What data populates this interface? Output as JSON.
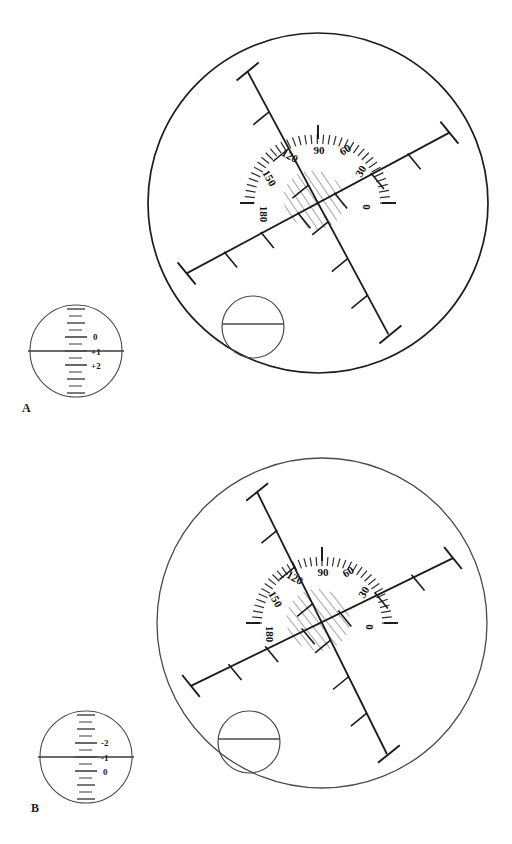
{
  "figure": {
    "background_color": "#ffffff",
    "ink_color": "#1d1d1d",
    "faint_ink_color": "#6b6b6b",
    "panels": [
      {
        "id": "A",
        "label": "A",
        "label_x": 22,
        "label_y": 409,
        "dial": {
          "cx": 76,
          "cy": 351,
          "r": 46,
          "scale_axis": "vertical",
          "meridian_line_y": 351,
          "major_labels": [
            {
              "text": "0",
              "value": 0,
              "y_offset": -24
            },
            {
              "text": "+1",
              "value": 1,
              "y_offset": 0
            },
            {
              "text": "+2",
              "value": 2,
              "y_offset": 24
            }
          ],
          "reading": "+1",
          "tick_count": 13,
          "tick_spacing": 6
        },
        "reticle": {
          "cx": 318,
          "cy": 203,
          "r": 170,
          "protractor": {
            "radius": 62,
            "arc_from_deg": 0,
            "arc_to_deg": 180,
            "labels": [
              {
                "text": "0",
                "deg": 0
              },
              {
                "text": "30",
                "deg": 30
              },
              {
                "text": "60",
                "deg": 60
              },
              {
                "text": "90",
                "deg": 90
              },
              {
                "text": "120",
                "deg": 120
              },
              {
                "text": "150",
                "deg": 150
              },
              {
                "text": "180",
                "deg": 180
              }
            ],
            "minor_tick_step_deg": 5
          },
          "cross": {
            "primary_axis_deg": 28,
            "secondary_axis_deg": 118,
            "arm_length": 150,
            "ticks_per_arm": 5,
            "tick_length": 12,
            "end_cap_length": 20
          },
          "reflex_patch": {
            "cx": 314,
            "cy": 200,
            "rx": 30,
            "ry": 28,
            "hatch_angle_deg": 118,
            "style": "hatched"
          },
          "inset_circle": {
            "cx": 253,
            "cy": 327,
            "r": 31,
            "chord_y_offset": -3
          }
        }
      },
      {
        "id": "B",
        "label": "B",
        "label_x": 31,
        "label_y": 809,
        "dial": {
          "cx": 86,
          "cy": 757,
          "r": 46,
          "scale_axis": "vertical",
          "meridian_line_y": 757,
          "major_labels": [
            {
              "text": "-2",
              "value": -2,
              "y_offset": -24
            },
            {
              "text": "-1",
              "value": -1,
              "y_offset": 0
            },
            {
              "text": "0",
              "value": 0,
              "y_offset": 24
            }
          ],
          "reading": "-1",
          "tick_count": 13,
          "tick_spacing": 6
        },
        "reticle": {
          "cx": 322,
          "cy": 623,
          "r": 165,
          "protractor": {
            "radius": 60,
            "arc_from_deg": 0,
            "arc_to_deg": 180,
            "labels": [
              {
                "text": "0",
                "deg": 0
              },
              {
                "text": "30",
                "deg": 30
              },
              {
                "text": "60",
                "deg": 60
              },
              {
                "text": "90",
                "deg": 90
              },
              {
                "text": "120",
                "deg": 120
              },
              {
                "text": "150",
                "deg": 150
              },
              {
                "text": "180",
                "deg": 180
              }
            ],
            "minor_tick_step_deg": 5
          },
          "cross": {
            "primary_axis_deg": 26,
            "secondary_axis_deg": 116,
            "arm_length": 148,
            "ticks_per_arm": 5,
            "tick_length": 12,
            "end_cap_length": 20
          },
          "reflex_patch": {
            "cx": 318,
            "cy": 620,
            "rx": 30,
            "ry": 30,
            "hatch_angle_deg": 116,
            "style": "hatched"
          },
          "inset_circle": {
            "cx": 241,
            "cy": 735,
            "r": 31,
            "chord_y_offset": -3
          }
        }
      }
    ]
  }
}
